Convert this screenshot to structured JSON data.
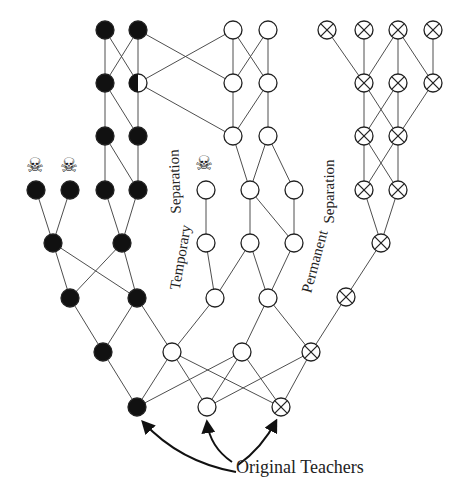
{
  "diagram": {
    "caption": "Original Teachers",
    "labels": {
      "temporary": "Temporary",
      "temporary_separation": "Separation",
      "permanent": "Permanent",
      "permanent_separation": "Separation"
    },
    "skull_glyph": "☠",
    "skulls": [
      {
        "x": 36,
        "y": 165
      },
      {
        "x": 70,
        "y": 165
      },
      {
        "x": 205,
        "y": 163
      }
    ],
    "node_radius": 9,
    "nodes": [
      {
        "id": "b1a",
        "x": 105,
        "y": 30,
        "type": "black"
      },
      {
        "id": "b1b",
        "x": 138,
        "y": 30,
        "type": "black"
      },
      {
        "id": "b2a",
        "x": 105,
        "y": 83,
        "type": "black"
      },
      {
        "id": "b2b",
        "x": 138,
        "y": 83,
        "type": "half"
      },
      {
        "id": "b3a",
        "x": 105,
        "y": 136,
        "type": "black"
      },
      {
        "id": "b3b",
        "x": 138,
        "y": 136,
        "type": "black"
      },
      {
        "id": "b4a",
        "x": 36,
        "y": 190,
        "type": "black"
      },
      {
        "id": "b4b",
        "x": 70,
        "y": 190,
        "type": "black"
      },
      {
        "id": "b4c",
        "x": 105,
        "y": 190,
        "type": "black"
      },
      {
        "id": "b4d",
        "x": 138,
        "y": 190,
        "type": "black"
      },
      {
        "id": "b5a",
        "x": 53,
        "y": 243,
        "type": "black"
      },
      {
        "id": "b5b",
        "x": 122,
        "y": 243,
        "type": "black"
      },
      {
        "id": "b6a",
        "x": 70,
        "y": 298,
        "type": "black"
      },
      {
        "id": "b6b",
        "x": 137,
        "y": 298,
        "type": "black"
      },
      {
        "id": "b7a",
        "x": 103,
        "y": 352,
        "type": "black"
      },
      {
        "id": "b8a",
        "x": 137,
        "y": 407,
        "type": "black"
      },
      {
        "id": "o1a",
        "x": 233,
        "y": 30,
        "type": "open"
      },
      {
        "id": "o1b",
        "x": 268,
        "y": 30,
        "type": "open"
      },
      {
        "id": "o2a",
        "x": 233,
        "y": 83,
        "type": "open"
      },
      {
        "id": "o2b",
        "x": 268,
        "y": 83,
        "type": "open"
      },
      {
        "id": "o3a",
        "x": 233,
        "y": 136,
        "type": "open"
      },
      {
        "id": "o3b",
        "x": 268,
        "y": 136,
        "type": "open"
      },
      {
        "id": "o4a",
        "x": 206,
        "y": 190,
        "type": "open"
      },
      {
        "id": "o4b",
        "x": 250,
        "y": 190,
        "type": "open"
      },
      {
        "id": "o4c",
        "x": 294,
        "y": 190,
        "type": "open"
      },
      {
        "id": "o5a",
        "x": 206,
        "y": 243,
        "type": "open"
      },
      {
        "id": "o5b",
        "x": 250,
        "y": 243,
        "type": "open"
      },
      {
        "id": "o5c",
        "x": 294,
        "y": 243,
        "type": "open"
      },
      {
        "id": "o6a",
        "x": 215,
        "y": 298,
        "type": "open"
      },
      {
        "id": "o6b",
        "x": 268,
        "y": 298,
        "type": "open"
      },
      {
        "id": "o7a",
        "x": 172,
        "y": 352,
        "type": "open"
      },
      {
        "id": "o7b",
        "x": 242,
        "y": 352,
        "type": "open"
      },
      {
        "id": "o8a",
        "x": 207,
        "y": 407,
        "type": "open"
      },
      {
        "id": "x1a",
        "x": 327,
        "y": 30,
        "type": "crossed"
      },
      {
        "id": "x1b",
        "x": 364,
        "y": 30,
        "type": "crossed"
      },
      {
        "id": "x1c",
        "x": 398,
        "y": 30,
        "type": "crossed"
      },
      {
        "id": "x1d",
        "x": 433,
        "y": 30,
        "type": "crossed"
      },
      {
        "id": "x2a",
        "x": 364,
        "y": 83,
        "type": "crossed"
      },
      {
        "id": "x2b",
        "x": 398,
        "y": 83,
        "type": "crossed"
      },
      {
        "id": "x2c",
        "x": 433,
        "y": 83,
        "type": "crossed"
      },
      {
        "id": "x3a",
        "x": 364,
        "y": 136,
        "type": "crossed"
      },
      {
        "id": "x3b",
        "x": 398,
        "y": 136,
        "type": "crossed"
      },
      {
        "id": "x4a",
        "x": 364,
        "y": 190,
        "type": "crossed"
      },
      {
        "id": "x4b",
        "x": 398,
        "y": 190,
        "type": "crossed"
      },
      {
        "id": "x5a",
        "x": 381,
        "y": 243,
        "type": "crossed"
      },
      {
        "id": "x6a",
        "x": 346,
        "y": 297,
        "type": "crossed"
      },
      {
        "id": "x7a",
        "x": 311,
        "y": 352,
        "type": "crossed"
      },
      {
        "id": "x8a",
        "x": 281,
        "y": 407,
        "type": "crossed"
      }
    ],
    "edges": [
      [
        "b1a",
        "b2a"
      ],
      [
        "b1a",
        "b2b"
      ],
      [
        "b1b",
        "b2a"
      ],
      [
        "b1b",
        "b2b"
      ],
      [
        "b1b",
        "o2a"
      ],
      [
        "b2b",
        "o1a"
      ],
      [
        "b2b",
        "o3a"
      ],
      [
        "b2a",
        "b3a"
      ],
      [
        "b2a",
        "b3b"
      ],
      [
        "b2b",
        "b3b"
      ],
      [
        "b3a",
        "b4c"
      ],
      [
        "b3a",
        "b4d"
      ],
      [
        "b3b",
        "b4d"
      ],
      [
        "b4a",
        "b5a"
      ],
      [
        "b4b",
        "b5a"
      ],
      [
        "b4c",
        "b5b"
      ],
      [
        "b4d",
        "b5b"
      ],
      [
        "b5a",
        "b6a"
      ],
      [
        "b5a",
        "b6b"
      ],
      [
        "b5b",
        "b6a"
      ],
      [
        "b5b",
        "b6b"
      ],
      [
        "b6a",
        "b7a"
      ],
      [
        "b6b",
        "b7a"
      ],
      [
        "b6b",
        "o7a"
      ],
      [
        "b7a",
        "b8a"
      ],
      [
        "b8a",
        "o7a"
      ],
      [
        "b8a",
        "o7b"
      ],
      [
        "o1a",
        "o2a"
      ],
      [
        "o1a",
        "o2b"
      ],
      [
        "o1b",
        "o2a"
      ],
      [
        "o1b",
        "o2b"
      ],
      [
        "o2a",
        "o3a"
      ],
      [
        "o2b",
        "o3a"
      ],
      [
        "o2b",
        "o3b"
      ],
      [
        "o3a",
        "o4b"
      ],
      [
        "o3b",
        "o4b"
      ],
      [
        "o3b",
        "o4c"
      ],
      [
        "o4a",
        "o5a"
      ],
      [
        "o4b",
        "o5b"
      ],
      [
        "o4b",
        "o5c"
      ],
      [
        "o4c",
        "o5c"
      ],
      [
        "o5a",
        "o6a"
      ],
      [
        "o5b",
        "o6a"
      ],
      [
        "o5b",
        "o6b"
      ],
      [
        "o5c",
        "o6b"
      ],
      [
        "o6a",
        "o7a"
      ],
      [
        "o6b",
        "o7b"
      ],
      [
        "o6b",
        "x7a"
      ],
      [
        "o7a",
        "o8a"
      ],
      [
        "o7b",
        "o8a"
      ],
      [
        "o7b",
        "x8a"
      ],
      [
        "o7a",
        "x8a"
      ],
      [
        "o8a",
        "x7a"
      ],
      [
        "x1a",
        "x2a"
      ],
      [
        "x1b",
        "x2a"
      ],
      [
        "x1c",
        "x2a"
      ],
      [
        "x1c",
        "x2b"
      ],
      [
        "x1c",
        "x2c"
      ],
      [
        "x1d",
        "x2c"
      ],
      [
        "x2a",
        "x3a"
      ],
      [
        "x2a",
        "x3b"
      ],
      [
        "x2b",
        "x3a"
      ],
      [
        "x2b",
        "x3b"
      ],
      [
        "x2c",
        "x3b"
      ],
      [
        "x3a",
        "x4a"
      ],
      [
        "x3a",
        "x4b"
      ],
      [
        "x3b",
        "x4a"
      ],
      [
        "x3b",
        "x4b"
      ],
      [
        "x4a",
        "x5a"
      ],
      [
        "x4b",
        "x5a"
      ],
      [
        "x5a",
        "x6a"
      ],
      [
        "x6a",
        "x7a"
      ],
      [
        "x7a",
        "x8a"
      ]
    ],
    "arrows": [
      {
        "target": "b8a",
        "path": "M 236 472 Q 180 462 143 422"
      },
      {
        "target": "o8a",
        "path": "M 232 462 Q 210 447 207 422"
      },
      {
        "target": "x8a",
        "path": "M 238 465 Q 262 448 276 421"
      }
    ],
    "colors": {
      "ink": "#111111",
      "line": "#3a3a3a",
      "background": "#ffffff"
    }
  }
}
